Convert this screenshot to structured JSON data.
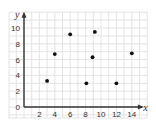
{
  "chart_data": {
    "type": "scatter",
    "title": "",
    "xlabel": "x",
    "ylabel": "y",
    "xlim": [
      0,
      16
    ],
    "ylim": [
      0,
      12
    ],
    "grid": true,
    "x_ticks": [
      2,
      4,
      6,
      8,
      10,
      12,
      14
    ],
    "y_ticks": [
      2,
      4,
      6,
      8,
      10
    ],
    "origin_label": "0",
    "points": [
      {
        "x": 3,
        "y": 3.3
      },
      {
        "x": 4,
        "y": 6.7
      },
      {
        "x": 6,
        "y": 9.2
      },
      {
        "x": 8.1,
        "y": 3.0
      },
      {
        "x": 8.9,
        "y": 6.3
      },
      {
        "x": 9.2,
        "y": 9.5
      },
      {
        "x": 12,
        "y": 3.0
      },
      {
        "x": 14,
        "y": 6.8
      }
    ]
  },
  "colors": {
    "grid": "#dddddd",
    "axis": "#333333",
    "point": "#111111"
  }
}
